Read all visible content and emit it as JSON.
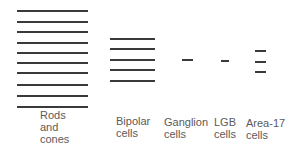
{
  "diagram": {
    "groups": [
      {
        "id": "rods",
        "label_lines": [
          "Rods",
          "and",
          "cones"
        ],
        "line_count": 10,
        "x1": 17,
        "x2": 88,
        "ys": [
          10,
          21,
          31,
          42,
          52,
          62,
          72,
          84,
          95,
          106
        ],
        "label_x": 40,
        "label_y": 110
      },
      {
        "id": "bipolar",
        "label_lines": [
          "Bipolar",
          "cells"
        ],
        "line_count": 5,
        "x1": 110,
        "x2": 155,
        "ys": [
          38,
          48,
          59,
          69,
          80
        ],
        "label_x": 115,
        "label_y": 115
      },
      {
        "id": "ganglion",
        "label_lines": [
          "Ganglion",
          "cells"
        ],
        "line_count": 1,
        "x1": 182,
        "x2": 193,
        "ys": [
          59
        ],
        "label_x": 164,
        "label_y": 116
      },
      {
        "id": "lgb",
        "label_lines": [
          "LGB",
          "cells"
        ],
        "line_count": 1,
        "x1": 221,
        "x2": 229,
        "ys": [
          60
        ],
        "label_x": 214,
        "label_y": 116
      },
      {
        "id": "area17",
        "label_lines": [
          "Area-17",
          "cells"
        ],
        "line_count": 3,
        "x1": 255,
        "x2": 266,
        "ys": [
          50,
          61,
          71
        ],
        "label_x": 245,
        "label_y": 116
      }
    ],
    "line_color": "#3a3a3a"
  }
}
